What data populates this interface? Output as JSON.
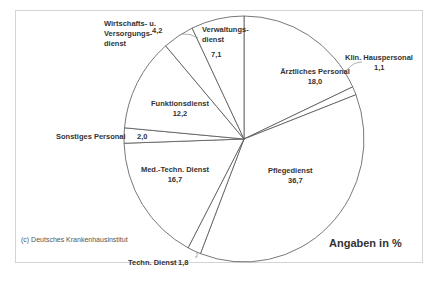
{
  "chart_data": {
    "type": "pie",
    "title": "",
    "unit_label": "Angaben in %",
    "source": "(c) Deutsches Krankenhausinstitut",
    "start_angle_deg": 0,
    "direction": "clockwise",
    "slices": [
      {
        "label": "Ärztliches Personal",
        "value": 18.0,
        "value_text": "18,0"
      },
      {
        "label": "Klin. Hauspersonal",
        "value": 1.1,
        "value_text": "1,1"
      },
      {
        "label": "Pflegedienst",
        "value": 36.7,
        "value_text": "36,7"
      },
      {
        "label": "Techn. Dienst",
        "value": 1.8,
        "value_text": "1,8"
      },
      {
        "label": "Med.-Techn. Dienst",
        "value": 16.7,
        "value_text": "16,7"
      },
      {
        "label": "Sonstiges Personal",
        "value": 2.0,
        "value_text": "2,0"
      },
      {
        "label": "Funktionsdienst",
        "value": 12.2,
        "value_text": "12,2"
      },
      {
        "label": "Wirtschafts- u. Versorgungs-dienst",
        "value": 4.2,
        "value_text": "4,2"
      },
      {
        "label": "Verwaltungs-dienst",
        "value": 7.1,
        "value_text": "7,1"
      }
    ],
    "colors": {
      "fill": "#ffffff",
      "stroke": "#555555"
    }
  },
  "labels": {
    "aerztlich": {
      "name": "Ärztliches Personal",
      "value": "18,0"
    },
    "klin": {
      "name": "Klin. Hauspersonal",
      "value": "1,1"
    },
    "pflege": {
      "name": "Pflegedienst",
      "value": "36,7"
    },
    "techn": {
      "name": "Techn. Dienst",
      "value": "1,8"
    },
    "medtechn": {
      "name": "Med.-Techn. Dienst",
      "value": "16,7"
    },
    "sonst": {
      "name": "Sonstiges Personal",
      "value": "2,0"
    },
    "funktion": {
      "name": "Funktionsdienst",
      "value": "12,2"
    },
    "wirtschaft": {
      "line1": "Wirtschafts- u.",
      "line2": "Versorgungs-",
      "line3": "dienst",
      "value": "4,2"
    },
    "verwaltung": {
      "line1": "Verwaltungs-",
      "line2": "dienst",
      "value": "7,1"
    }
  },
  "unit_label": "Angaben in %",
  "source": "(c) Deutsches Krankenhausinstitut"
}
